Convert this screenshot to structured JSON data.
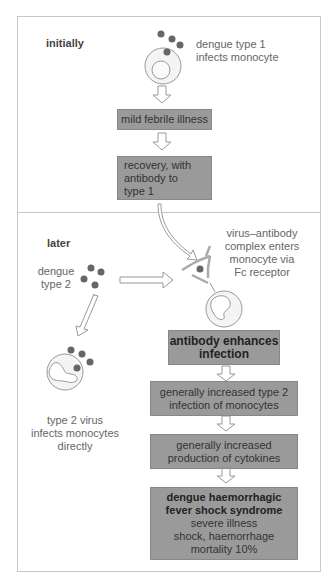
{
  "sections": {
    "initially": {
      "label": "initially"
    },
    "later": {
      "label": "later"
    }
  },
  "initially": {
    "cell_caption": [
      "dengue type 1",
      "infects monocyte"
    ],
    "box1": "mild febrile illness",
    "box2": [
      "recovery, with",
      "antibody to",
      "type 1"
    ]
  },
  "later": {
    "virus_label": [
      "dengue",
      "type 2"
    ],
    "complex_caption": [
      "virus–antibody",
      "complex enters",
      "monocyte via",
      "Fc receptor"
    ],
    "direct_caption": [
      "type 2 virus",
      "infects monocytes",
      "directly"
    ],
    "box_enhance": [
      "antibody enhances",
      "infection"
    ],
    "box_infection": [
      "generally increased type 2",
      "infection of monocytes"
    ],
    "box_cytokines": [
      "generally increased",
      "production of cytokines"
    ],
    "box_final": {
      "title": [
        "dengue haemorrhagic",
        "fever shock syndrome"
      ],
      "lines": [
        "severe illness",
        "shock, haemorrhage",
        "mortality 10%"
      ]
    }
  },
  "colors": {
    "box": "#9a9a9a",
    "virus": "#666666",
    "border": "#c8c8c8"
  }
}
